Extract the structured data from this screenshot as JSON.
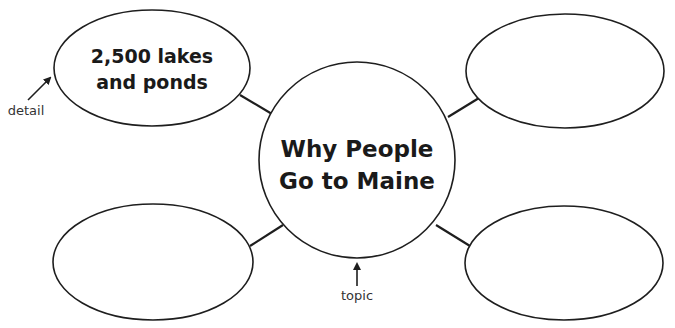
{
  "diagram": {
    "type": "web-organizer",
    "topic": {
      "line1": "Why People",
      "line2": "Go to Maine"
    },
    "details": [
      {
        "position": "top-left",
        "line1": "2,500 lakes",
        "line2": "and ponds"
      },
      {
        "position": "top-right",
        "line1": "",
        "line2": ""
      },
      {
        "position": "bottom-left",
        "line1": "",
        "line2": ""
      },
      {
        "position": "bottom-right",
        "line1": "",
        "line2": ""
      }
    ],
    "labels": {
      "detail": "detail",
      "topic": "topic"
    }
  }
}
